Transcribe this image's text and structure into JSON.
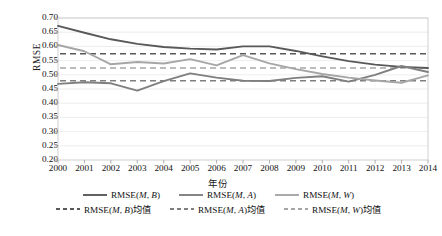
{
  "chart_data": {
    "type": "line",
    "title": "",
    "xlabel": "年份",
    "ylabel": "RMSE",
    "x": [
      2000,
      2001,
      2002,
      2003,
      2004,
      2005,
      2006,
      2007,
      2008,
      2009,
      2010,
      2011,
      2012,
      2013,
      2014
    ],
    "xticklabels": [
      "2000",
      "2001",
      "2002",
      "2003",
      "2004",
      "2005",
      "2006",
      "2007",
      "2008",
      "2009",
      "2010",
      "2011",
      "2012",
      "2013",
      "2014"
    ],
    "yticklabels": [
      "0.70",
      "0.65",
      "0.60",
      "0.55",
      "0.50",
      "0.45",
      "0.40",
      "0.35",
      "0.30",
      "0.25",
      "0.20"
    ],
    "ytickvalues": [
      0.7,
      0.65,
      0.6,
      0.55,
      0.5,
      0.45,
      0.4,
      0.35,
      0.3,
      0.25,
      0.2
    ],
    "ylim": [
      0.2,
      0.7
    ],
    "xlim": [
      2000,
      2014
    ],
    "grid": true,
    "legend_position": "bottom",
    "series": [
      {
        "name": "RMSE(M, B)",
        "style": "solid",
        "color": "#595959",
        "values": [
          0.672,
          0.648,
          0.625,
          0.609,
          0.598,
          0.592,
          0.589,
          0.6,
          0.6,
          0.584,
          0.565,
          0.548,
          0.536,
          0.528,
          0.524
        ]
      },
      {
        "name": "RMSE(M, A)",
        "style": "solid",
        "color": "#7f7f7f",
        "values": [
          0.468,
          0.474,
          0.47,
          0.444,
          0.478,
          0.505,
          0.49,
          0.479,
          0.478,
          0.489,
          0.495,
          0.476,
          0.5,
          0.531,
          0.51
        ]
      },
      {
        "name": "RMSE(M, W)",
        "style": "solid",
        "color": "#a6a6a6",
        "values": [
          0.605,
          0.583,
          0.537,
          0.545,
          0.54,
          0.555,
          0.533,
          0.569,
          0.54,
          0.52,
          0.503,
          0.49,
          0.48,
          0.472,
          0.498
        ]
      }
    ],
    "mean_lines": [
      {
        "name": "RMSE(M, B)均值",
        "style": "dashed",
        "color": "#595959",
        "value": 0.5743
      },
      {
        "name": "RMSE(M, A)均值",
        "style": "dashed",
        "color": "#a6a6a6",
        "value": 0.5243
      },
      {
        "name": "RMSE(M, W)均值",
        "style": "dashed",
        "color": "#7f7f7f",
        "value": 0.4792
      }
    ]
  },
  "legend": {
    "row1": [
      {
        "label_pre": "RMSE(",
        "label_m": "M",
        "label_sep": ", ",
        "label_arg": "B",
        "label_post": ")",
        "color": "#595959",
        "style": "solid"
      },
      {
        "label_pre": "RMSE(",
        "label_m": "M",
        "label_sep": ", ",
        "label_arg": "A",
        "label_post": ")",
        "color": "#7f7f7f",
        "style": "solid"
      },
      {
        "label_pre": "RMSE(",
        "label_m": "M",
        "label_sep": ", ",
        "label_arg": "W",
        "label_post": ")",
        "color": "#a6a6a6",
        "style": "solid"
      }
    ],
    "row2": [
      {
        "label_pre": "RMSE(",
        "label_m": "M",
        "label_sep": ", ",
        "label_arg": "B",
        "label_post": ")均值",
        "color": "#595959",
        "style": "dashed"
      },
      {
        "label_pre": "RMSE(",
        "label_m": "M",
        "label_sep": ", ",
        "label_arg": "A",
        "label_post": ")均值",
        "color": "#7f7f7f",
        "style": "dashed"
      },
      {
        "label_pre": "RMSE(",
        "label_m": "M",
        "label_sep": ", ",
        "label_arg": "W",
        "label_post": ")均值",
        "color": "#a6a6a6",
        "style": "dashed"
      }
    ]
  },
  "axes": {
    "ylabel": "RMSE",
    "xlabel": "年份"
  }
}
